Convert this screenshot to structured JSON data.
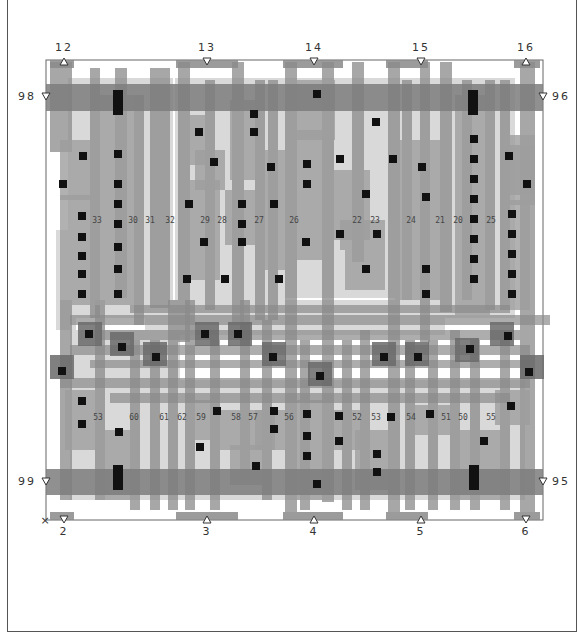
{
  "diagram": {
    "type": "vlsi-cell-layout",
    "colors": {
      "background": "#ffffff",
      "border": "#555555",
      "diffusion": "#c8c8c8",
      "poly": "#8a8a8a",
      "metal1": "#9d9d9d",
      "power_rail": "#7d7d7d",
      "contact": "#111111",
      "light_fill": "#d9d9d9"
    },
    "top_pins": [
      {
        "label": "12",
        "marker": "up"
      },
      {
        "label": "13",
        "marker": "down"
      },
      {
        "label": "14",
        "marker": "down"
      },
      {
        "label": "15",
        "marker": "down"
      },
      {
        "label": "16",
        "marker": "up"
      }
    ],
    "bottom_pins": [
      {
        "label": "2",
        "marker": "down"
      },
      {
        "label": "3",
        "marker": "up"
      },
      {
        "label": "4",
        "marker": "up"
      },
      {
        "label": "5",
        "marker": "up"
      },
      {
        "label": "6",
        "marker": "down"
      }
    ],
    "side_pins": {
      "left_top": "98",
      "right_top": "96",
      "left_bottom": "99",
      "right_bottom": "95"
    },
    "origin_marker": "×",
    "net_labels_upper": [
      "33",
      "30",
      "31",
      "32",
      "29",
      "28",
      "27",
      "26",
      "22",
      "23",
      "24",
      "21",
      "20",
      "25"
    ],
    "net_labels_lower": [
      "53",
      "60",
      "61",
      "62",
      "59",
      "58",
      "57",
      "56",
      "52",
      "53",
      "54",
      "51",
      "50",
      "55"
    ]
  }
}
